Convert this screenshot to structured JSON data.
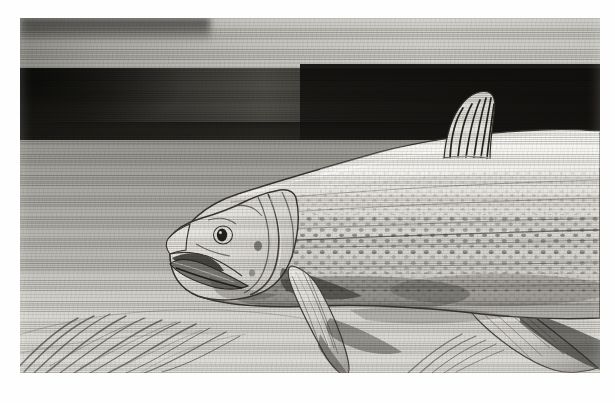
{
  "plate": {
    "title": "Fish illustration plate",
    "medium": "pencil / lithograph halftone",
    "subject_label": "fish-lateral-view",
    "caption": "",
    "frame": {
      "left": 20,
      "top": 18,
      "width": 580,
      "height": 355
    }
  },
  "palette": {
    "page_white": "#fefefe",
    "paper_light": "#dddcd6",
    "paper_mid": "#b9b9b4",
    "band_dark": "#1d1c19",
    "ink_dark": "#2a2823",
    "fish_body_light": "#efeee8",
    "fish_body_shade": "#c9c8c2",
    "outline": "#3a3833"
  },
  "scene": {
    "bands": [
      {
        "name": "upper-pale-band",
        "top": 0,
        "height": 50,
        "tone": "#c4c3bd"
      },
      {
        "name": "dark-horizon-band",
        "top": 50,
        "height": 72,
        "tone": "#1d1c19"
      },
      {
        "name": "mid-ground",
        "top": 122,
        "height": 150,
        "tone": "#a6a59f"
      },
      {
        "name": "lower-ground",
        "top": 255,
        "height": 100,
        "tone": "#d6d5cf"
      }
    ],
    "hatching": "horizontal-pencil-strokes",
    "foreground_elements": [
      {
        "name": "grass-strokes",
        "location": "bottom-left",
        "count": 14
      },
      {
        "name": "grass-strokes",
        "location": "bottom-right",
        "count": 5
      },
      {
        "name": "sand-mound",
        "location": "bottom-left"
      }
    ]
  },
  "fish": {
    "orientation": "head-left",
    "parts": [
      {
        "name": "snout",
        "note": "pointed, slightly upturned"
      },
      {
        "name": "mouth",
        "note": "open, lower jaw extended"
      },
      {
        "name": "eye",
        "note": "round with dark pupil and highlight"
      },
      {
        "name": "gill-cover",
        "note": "curved opercular lines"
      },
      {
        "name": "dorsal-fin",
        "note": "tall, 6 ray lines, against dark band"
      },
      {
        "name": "pectoral-fin",
        "note": "long, angled down-left"
      },
      {
        "name": "pelvic-fin",
        "note": "lower rear, angled down-right"
      },
      {
        "name": "body-scales",
        "note": "dotted rows along flank"
      },
      {
        "name": "lateral-line",
        "note": "faint horizontal row"
      }
    ],
    "scale_rows": 7,
    "dorsal_fin_rays": 6
  }
}
